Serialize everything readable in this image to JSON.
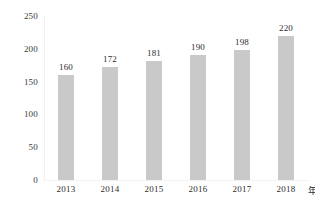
{
  "chart_data": {
    "type": "bar",
    "title": "",
    "xlabel": "年",
    "ylabel": "",
    "categories": [
      "2013",
      "2014",
      "2015",
      "2016",
      "2017",
      "2018"
    ],
    "values": [
      160,
      172,
      181,
      190,
      198,
      220
    ],
    "data_labels": [
      "160",
      "172",
      "181",
      "190",
      "198",
      "220"
    ],
    "ylim": [
      0,
      250
    ],
    "ytick_values": [
      0,
      50,
      100,
      150,
      200,
      250
    ],
    "ytick_labels": [
      "0",
      "50",
      "100",
      "150",
      "200",
      "250"
    ],
    "grid": false,
    "legend": null,
    "series": [
      {
        "name": "",
        "values": [
          160,
          172,
          181,
          190,
          198,
          220
        ]
      }
    ],
    "colors": {
      "bar_fill": "#c9c9c9",
      "text": "#2e2e2e",
      "axis": "#f0f0f0",
      "background": "#ffffff"
    }
  }
}
